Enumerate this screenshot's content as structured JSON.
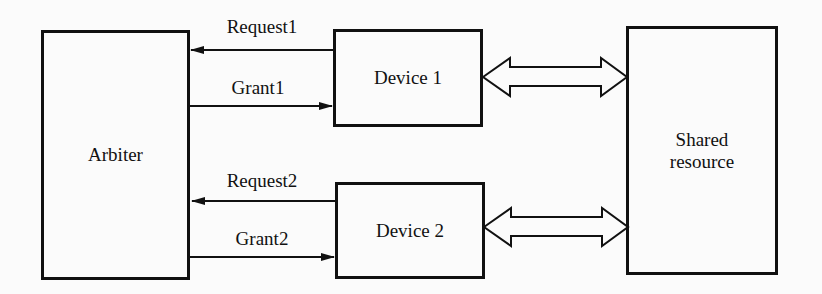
{
  "diagram": {
    "type": "block-diagram",
    "nodes": {
      "arbiter": {
        "label": "Arbiter"
      },
      "device1": {
        "label": "Device 1"
      },
      "device2": {
        "label": "Device 2"
      },
      "shared": {
        "label_line1": "Shared",
        "label_line2": "resource"
      }
    },
    "edges": {
      "request1": {
        "label": "Request1",
        "from": "Device 1",
        "to": "Arbiter"
      },
      "grant1": {
        "label": "Grant1",
        "from": "Arbiter",
        "to": "Device 1"
      },
      "request2": {
        "label": "Request2",
        "from": "Device 2",
        "to": "Arbiter"
      },
      "grant2": {
        "label": "Grant2",
        "from": "Arbiter",
        "to": "Device 2"
      },
      "bus1": {
        "label": "",
        "from": "Device 1",
        "to": "Shared resource",
        "bidirectional": true
      },
      "bus2": {
        "label": "",
        "from": "Device 2",
        "to": "Shared resource",
        "bidirectional": true
      }
    },
    "colors": {
      "stroke": "#111111",
      "background": "#fbfbfb"
    }
  }
}
